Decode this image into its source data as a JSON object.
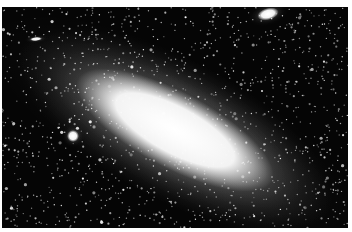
{
  "image": {
    "subject": "spiral galaxy with satellite galaxies",
    "background_color": "#050505",
    "frame_color": "#ffffff"
  },
  "objects": [
    {
      "name": "main-galaxy",
      "cx": 175,
      "cy": 130,
      "rx": 110,
      "ry": 38,
      "angle": 28,
      "color": "#ffffff"
    },
    {
      "name": "satellite-galaxy-upper-right",
      "cx": 268,
      "cy": 14,
      "rx": 11,
      "ry": 6,
      "angle": -15,
      "color": "#f0f0f0"
    },
    {
      "name": "satellite-galaxy-left",
      "cx": 73,
      "cy": 136,
      "rx": 6,
      "ry": 6,
      "angle": 0,
      "color": "#f5f5f5"
    },
    {
      "name": "small-galaxy-upper-left",
      "cx": 36,
      "cy": 39,
      "rx": 6,
      "ry": 2,
      "angle": -5,
      "color": "#bbbbbb"
    }
  ]
}
